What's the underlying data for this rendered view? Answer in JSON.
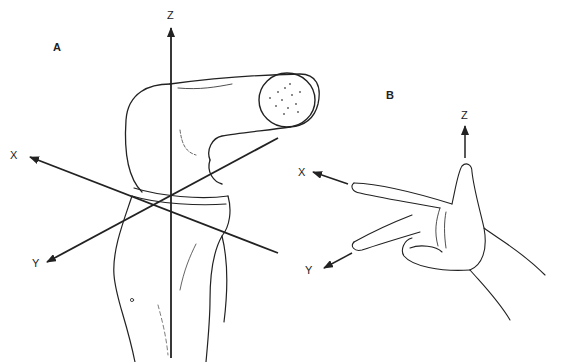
{
  "panels": [
    {
      "id": "A",
      "label": "A",
      "subject": "knee joint (femur and tibia)",
      "axes": {
        "x": "X",
        "y": "Y",
        "z": "Z"
      }
    },
    {
      "id": "B",
      "label": "B",
      "subject": "right hand showing coordinate convention",
      "axes": {
        "x": "X",
        "y": "Y",
        "z": "Z"
      }
    }
  ],
  "colors": {
    "ink": "#222222",
    "background": "#ffffff"
  }
}
